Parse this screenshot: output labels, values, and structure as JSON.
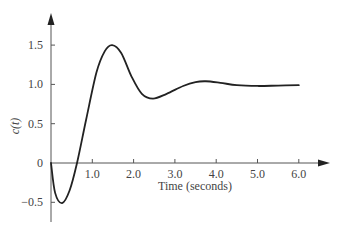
{
  "chart_data": {
    "type": "line",
    "title": "",
    "xlabel": "Time (seconds)",
    "ylabel": "c(t)",
    "xlim": [
      0,
      6.5
    ],
    "ylim": [
      -0.7,
      1.9
    ],
    "grid": false,
    "legend": null,
    "x_ticks": [
      "1.0",
      "2.0",
      "3.0",
      "4.0",
      "5.0",
      "6.0"
    ],
    "y_ticks": [
      "-0.5",
      "0",
      "0.5",
      "1.0",
      "1.5"
    ],
    "series": [
      {
        "name": "c(t)",
        "color": "#222222",
        "x": [
          0,
          0.1,
          0.27,
          0.45,
          0.63,
          0.85,
          1.1,
          1.3,
          1.48,
          1.7,
          1.95,
          2.2,
          2.47,
          2.8,
          3.2,
          3.5,
          3.75,
          4.1,
          4.5,
          5.0,
          5.5,
          6.0
        ],
        "y": [
          0,
          -0.38,
          -0.51,
          -0.35,
          0.0,
          0.55,
          1.15,
          1.42,
          1.5,
          1.4,
          1.1,
          0.88,
          0.82,
          0.88,
          0.98,
          1.03,
          1.04,
          1.02,
          0.99,
          0.98,
          0.985,
          0.99
        ]
      }
    ]
  }
}
